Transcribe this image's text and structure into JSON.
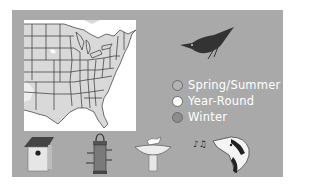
{
  "legend": {
    "items": [
      {
        "label": "Spring/Summer",
        "color": "#b3b3b3"
      },
      {
        "label": "Year-Round",
        "color": "#ffffff"
      },
      {
        "label": "Winter",
        "color": "#8c8c8c"
      }
    ]
  },
  "colors": {
    "panel_bg": "#a9a9a9",
    "map_bg": "#ffffff",
    "range_fill": "#d9d9d9",
    "state_lines": "#333333",
    "bird": "#333333"
  },
  "icons": {
    "bird": "nuthatch-silhouette",
    "birdhouse": "birdhouse-icon",
    "feeder": "tube-feeder-icon",
    "birdbath": "birdbath-icon",
    "song": "singing-bird-icon"
  }
}
